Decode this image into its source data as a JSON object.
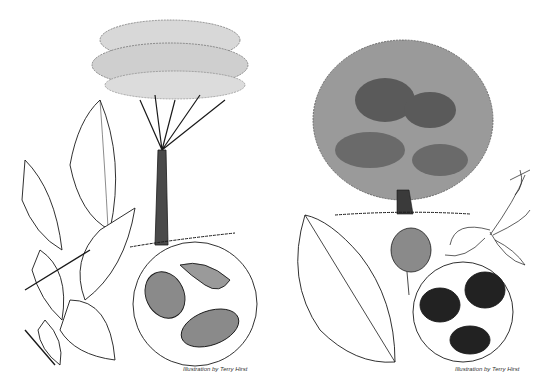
{
  "illustration": {
    "left_panel": {
      "subject": "tree-with-spreading-canopy, leafy-branch, seeds-in-circle",
      "caption": "Illustration by Terry Hirst"
    },
    "right_panel": {
      "subject": "tree-with-dense-round-canopy, large-leaf, fruit, flower, seeds-in-circle",
      "caption": "Illustration by Terry Hirst"
    },
    "colors": {
      "ink": "#1a1a1a",
      "background": "#ffffff"
    }
  }
}
